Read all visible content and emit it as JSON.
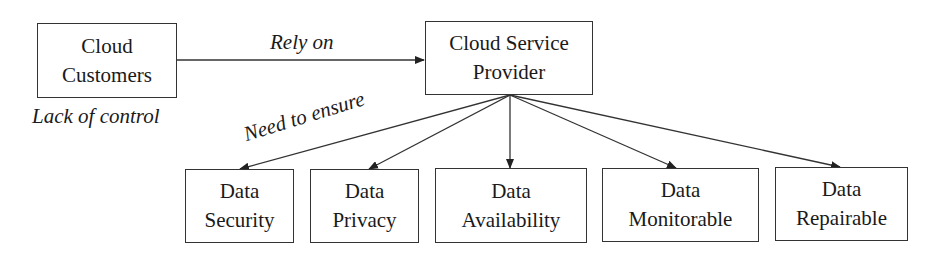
{
  "diagram": {
    "nodes": {
      "customers": {
        "line1": "Cloud",
        "line2": "Customers"
      },
      "provider": {
        "line1": "Cloud Service",
        "line2": "Provider"
      },
      "security": {
        "line1": "Data",
        "line2": "Security"
      },
      "privacy": {
        "line1": "Data",
        "line2": "Privacy"
      },
      "availability": {
        "line1": "Data",
        "line2": "Availability"
      },
      "monitorable": {
        "line1": "Data",
        "line2": "Monitorable"
      },
      "repairable": {
        "line1": "Data",
        "line2": "Repairable"
      }
    },
    "labels": {
      "rely_on": "Rely on",
      "lack_of_control": "Lack of control",
      "need_to_ensure": "Need to ensure"
    },
    "edges": [
      {
        "from": "customers",
        "to": "provider",
        "label": "Rely on"
      },
      {
        "from": "provider",
        "to": "security",
        "label": "Need to ensure"
      },
      {
        "from": "provider",
        "to": "privacy"
      },
      {
        "from": "provider",
        "to": "availability"
      },
      {
        "from": "provider",
        "to": "monitorable"
      },
      {
        "from": "provider",
        "to": "repairable"
      }
    ]
  }
}
